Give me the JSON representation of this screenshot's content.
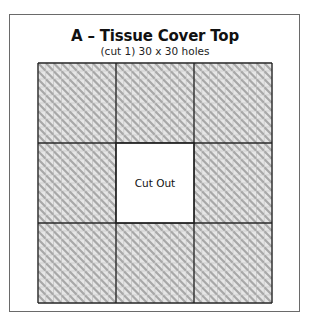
{
  "diagram": {
    "title": "A – Tissue Cover Top",
    "subtitle": "(cut 1) 30 x 30 holes",
    "cutout_label": "Cut Out",
    "grid": {
      "columns": 30,
      "rows": 30,
      "major_every": 10,
      "cutout": {
        "col_start": 10,
        "col_end": 20,
        "row_start": 10,
        "row_end": 20
      },
      "stitch": "diagonal tent stitch (top-left to bottom-right)"
    },
    "colors": {
      "frame": "#6a6a6a",
      "grid_minor": "#8a8a8a",
      "grid_major": "#222222",
      "stitch": "#a8a8a8",
      "cell_fill": "#e6e6e6",
      "background": "#ffffff"
    }
  }
}
